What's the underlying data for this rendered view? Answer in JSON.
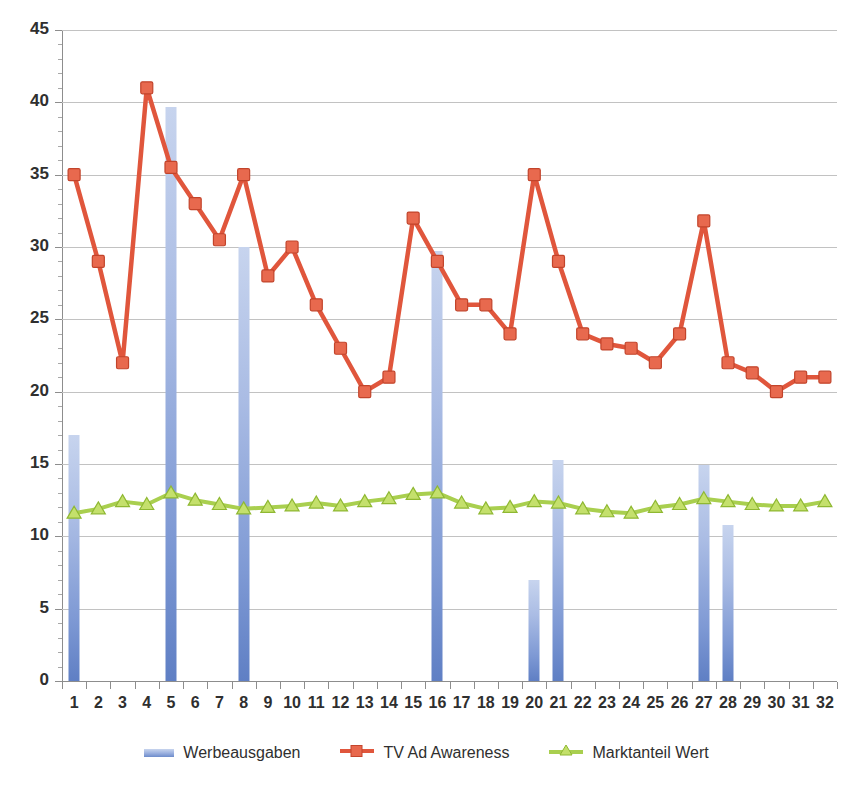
{
  "chart_data": {
    "type": "bar",
    "title": "",
    "subtitle": "",
    "xlabel": "",
    "ylabel": "",
    "ylim": [
      0,
      45
    ],
    "ytick_step": 5,
    "yminor_step": 1,
    "grid": true,
    "legend_position": "bottom",
    "categories": [
      "1",
      "2",
      "3",
      "4",
      "5",
      "6",
      "7",
      "8",
      "9",
      "10",
      "11",
      "12",
      "13",
      "14",
      "15",
      "16",
      "17",
      "18",
      "19",
      "20",
      "21",
      "22",
      "23",
      "24",
      "25",
      "26",
      "27",
      "28",
      "29",
      "30",
      "31",
      "32"
    ],
    "ytick_labels": [
      "0",
      "5",
      "10",
      "15",
      "20",
      "25",
      "30",
      "35",
      "40",
      "45"
    ],
    "series": [
      {
        "name": "Werbeausgaben",
        "type": "bar",
        "color": "#6d8ccb",
        "values": [
          17,
          0,
          0,
          0,
          39.7,
          0,
          0,
          30,
          0,
          0,
          0,
          0,
          0,
          0,
          0,
          29.7,
          0,
          0,
          0,
          7,
          15.3,
          0,
          0,
          0,
          0,
          0,
          14.9,
          10.8,
          0,
          0,
          0,
          0
        ]
      },
      {
        "name": "TV Ad Awareness",
        "type": "line",
        "color": "#e0563c",
        "marker": "square",
        "values": [
          35,
          29,
          22,
          41,
          35.5,
          33,
          30.5,
          35,
          28,
          30,
          26,
          23,
          20,
          21,
          32,
          29,
          26,
          26,
          24,
          35,
          29,
          24,
          23.3,
          23,
          22,
          24,
          31.8,
          22,
          21.3,
          20,
          21,
          21
        ]
      },
      {
        "name": "Marktanteil Wert",
        "type": "line",
        "color": "#a9cf4f",
        "marker": "triangle",
        "values": [
          11.6,
          11.9,
          12.4,
          12.2,
          13.0,
          12.5,
          12.2,
          11.9,
          12.0,
          12.1,
          12.3,
          12.1,
          12.4,
          12.6,
          12.9,
          13.0,
          12.3,
          11.9,
          12.0,
          12.4,
          12.3,
          11.9,
          11.7,
          11.6,
          12.0,
          12.2,
          12.6,
          12.4,
          12.2,
          12.1,
          12.1,
          12.4
        ]
      }
    ]
  },
  "legend": {
    "items": [
      {
        "label": "Werbeausgaben"
      },
      {
        "label": "TV Ad Awareness"
      },
      {
        "label": "Marktanteil Wert"
      }
    ]
  }
}
